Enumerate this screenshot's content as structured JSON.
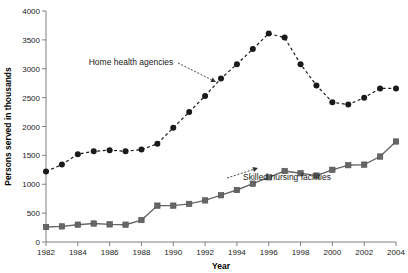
{
  "chart_data": {
    "type": "line",
    "title": "",
    "xlabel": "Year",
    "ylabel": "Persons served in thousands",
    "xlim": [
      1982,
      2004
    ],
    "ylim": [
      0,
      4000
    ],
    "ytick_labels": [
      "0",
      "500",
      "1000",
      "1500",
      "2000",
      "2500",
      "3000",
      "3500",
      "4000"
    ],
    "ytick_values": [
      0,
      500,
      1000,
      1500,
      2000,
      2500,
      3000,
      3500,
      4000
    ],
    "xtick_labels": [
      "1982",
      "1984",
      "1986",
      "1988",
      "1990",
      "1992",
      "1994",
      "1996",
      "1998",
      "2000",
      "2002",
      "2004"
    ],
    "xtick_values": [
      1982,
      1984,
      1986,
      1988,
      1990,
      1992,
      1994,
      1996,
      1998,
      2000,
      2002,
      2004
    ],
    "grid": false,
    "legend": "annotations-inline",
    "x": [
      1982,
      1983,
      1984,
      1985,
      1986,
      1987,
      1988,
      1989,
      1990,
      1991,
      1992,
      1993,
      1994,
      1995,
      1996,
      1997,
      1998,
      1999,
      2000,
      2001,
      2002,
      2003,
      2004
    ],
    "series": [
      {
        "name": "Home health agencies",
        "marker": "circle",
        "linestyle": "dashed",
        "color": "#1a1a1a",
        "values": [
          1220,
          1340,
          1520,
          1570,
          1590,
          1570,
          1600,
          1700,
          1980,
          2250,
          2530,
          2830,
          3080,
          3340,
          3610,
          3540,
          3080,
          2710,
          2420,
          2380,
          2500,
          2660,
          2660
        ]
      },
      {
        "name": "Skilled nursing facilities",
        "marker": "square",
        "linestyle": "solid",
        "color": "#666666",
        "values": [
          260,
          270,
          300,
          320,
          305,
          300,
          380,
          630,
          630,
          660,
          720,
          810,
          900,
          1010,
          1120,
          1230,
          1190,
          1150,
          1250,
          1330,
          1340,
          1480,
          1740
        ]
      }
    ],
    "annotations": [
      {
        "text": "Home health agencies",
        "x_px": 131,
        "y_px": 65,
        "arrow_to_x_px": 216,
        "arrow_to_y_px": 82
      },
      {
        "text": "Skilled nursing facilities",
        "x_px": 287,
        "y_px": 180,
        "arrow_to_x_px": 258,
        "arrow_to_y_px": 168
      }
    ]
  }
}
